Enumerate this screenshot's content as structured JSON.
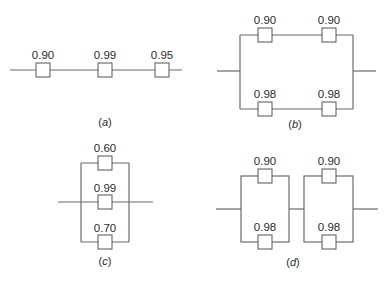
{
  "diagrams": {
    "a": {
      "caption_open": "(",
      "caption_letter": "a",
      "caption_close": ")",
      "type": "series",
      "components": [
        "0.90",
        "0.99",
        "0.95"
      ]
    },
    "b": {
      "caption_open": "(",
      "caption_letter": "b",
      "caption_close": ")",
      "type": "parallel-of-series",
      "top_branch": [
        "0.90",
        "0.90"
      ],
      "bottom_branch": [
        "0.98",
        "0.98"
      ]
    },
    "c": {
      "caption_open": "(",
      "caption_letter": "c",
      "caption_close": ")",
      "type": "parallel",
      "components": [
        "0.60",
        "0.99",
        "0.70"
      ]
    },
    "d": {
      "caption_open": "(",
      "caption_letter": "d",
      "caption_close": ")",
      "type": "series-of-parallel",
      "block1": [
        "0.90",
        "0.98"
      ],
      "block2": [
        "0.90",
        "0.98"
      ]
    }
  }
}
